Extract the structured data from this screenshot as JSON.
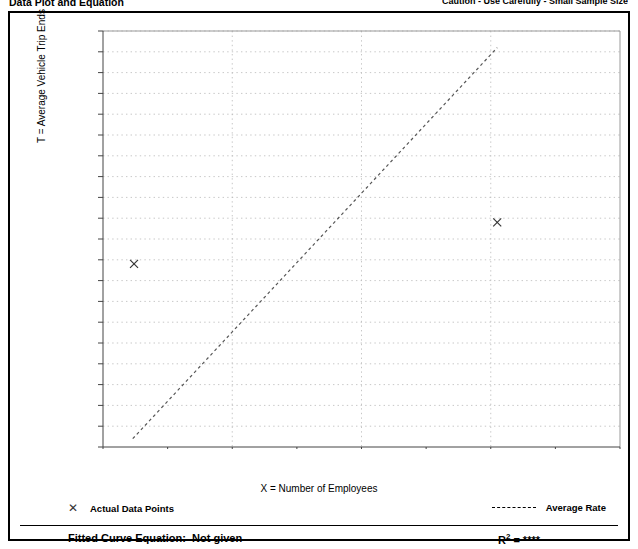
{
  "header": {
    "left_title": "Data Plot and Equation",
    "right_note": "Caution - Use Carefully - Small Sample Size"
  },
  "legend": {
    "data_points_marker": "x-marker-icon",
    "data_points_label": "Actual Data Points",
    "average_rate_marker": "dashed-line-icon",
    "average_rate_label": "Average Rate"
  },
  "equation": {
    "fitted_label": "Fitted Curve Equation:  Not given",
    "r_squared_prefix": "R",
    "r_squared_exponent": "2",
    "r_squared_value": " = ****"
  },
  "chart_data": {
    "type": "scatter",
    "title": "",
    "xlabel": "X = Number of Employees",
    "ylabel": "T = Average Vehicle Trip Ends",
    "xlim": [
      0,
      400
    ],
    "ylim": [
      10,
      210
    ],
    "grid": true,
    "legend_position": "below-plot",
    "xticks": [
      0,
      100,
      200,
      300,
      400
    ],
    "xticklabels": [
      "0",
      "100",
      "200",
      "300",
      "400"
    ],
    "x_minor_step": 50,
    "yticks": [
      10,
      20,
      30,
      40,
      50,
      60,
      70,
      80,
      90,
      100,
      110,
      120,
      130,
      140,
      150,
      160,
      170,
      180,
      190,
      200,
      210
    ],
    "yticklabels": [
      "10",
      "20",
      "30",
      "40",
      "50",
      "60",
      "70",
      "80",
      "90",
      "100",
      "110",
      "120",
      "130",
      "140",
      "150",
      "160",
      "170",
      "180",
      "190",
      "200",
      "210"
    ],
    "series": [
      {
        "name": "Actual Data Points",
        "type": "scatter",
        "marker": "x",
        "color": "#333333",
        "points": [
          {
            "x": 24,
            "y": 98
          },
          {
            "x": 305,
            "y": 118
          }
        ]
      },
      {
        "name": "Average Rate",
        "type": "line",
        "style": "dashed",
        "color": "#555555",
        "points": [
          {
            "x": 23,
            "y": 14
          },
          {
            "x": 305,
            "y": 202
          }
        ]
      }
    ]
  }
}
